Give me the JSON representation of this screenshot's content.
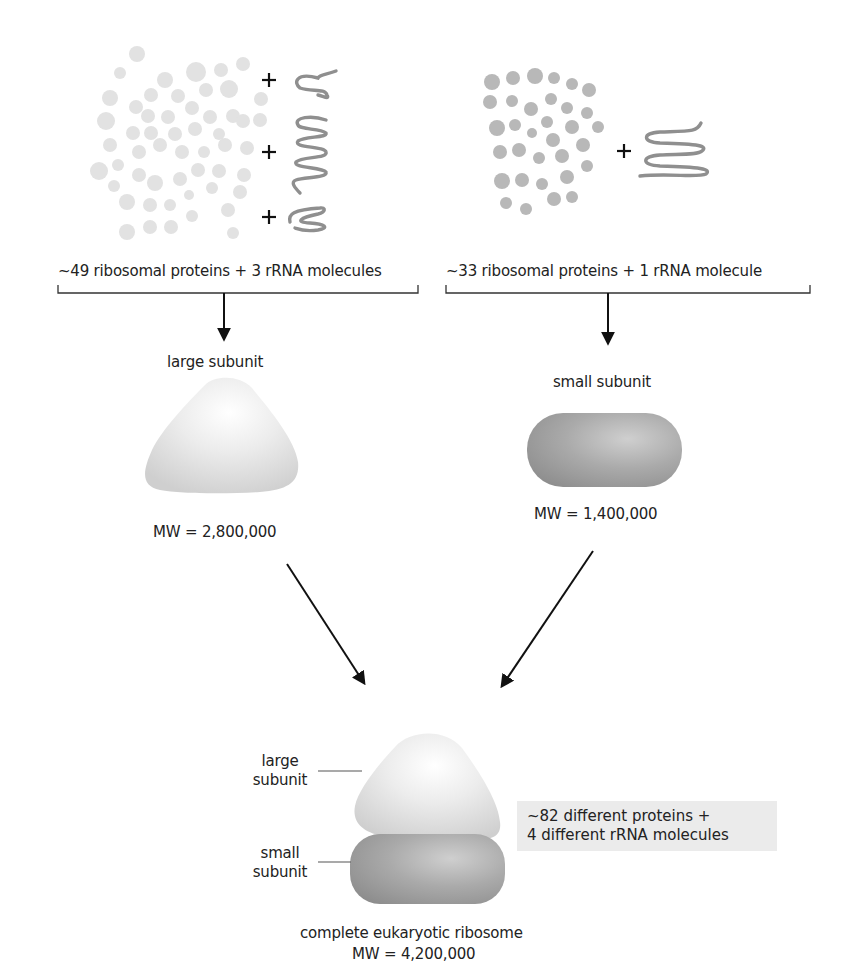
{
  "top_edge": {
    "note": "cropped text line at top edge (unreadable)"
  },
  "large_subunit_components": {
    "label": "~49 ribosomal proteins + 3 rRNA molecules",
    "protein_count": "~49",
    "rrna_count": "3",
    "plus_signs": [
      "+",
      "+",
      "+"
    ],
    "protein_color": "#e2e2e2",
    "rrna_color": "#8f8f8f"
  },
  "small_subunit_components": {
    "label": "~33 ribosomal proteins + 1 rRNA molecule",
    "protein_count": "~33",
    "rrna_count": "1",
    "plus_sign": "+",
    "protein_color": "#b8b8b8",
    "rrna_color": "#8f8f8f"
  },
  "large_subunit": {
    "title": "large subunit",
    "mw": "MW = 2,800,000",
    "color": "#e6e6e6"
  },
  "small_subunit": {
    "title": "small subunit",
    "mw": "MW = 1,400,000",
    "color": "#a9a9a9"
  },
  "ribosome": {
    "large_label_line1": "large",
    "large_label_line2": "subunit",
    "small_label_line1": "small",
    "small_label_line2": "subunit",
    "caption": "complete eukaryotic ribosome",
    "mw": "MW = 4,200,000",
    "note_line1": "~82 different proteins +",
    "note_line2": "4 different rRNA molecules"
  }
}
